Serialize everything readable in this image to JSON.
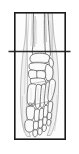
{
  "figure": {
    "kind": "anatomical-line-drawing",
    "caption": "",
    "title": "",
    "background_color": "#ffffff",
    "panel_fill": "#fdfdfd",
    "frame": {
      "name": "image-frame",
      "color": "#1a1a1a",
      "stroke_width": 1.6,
      "x": 14,
      "y": 12,
      "width": 52,
      "height": 128
    },
    "reference_line": {
      "name": "horizontal-section-line",
      "color": "#2b2b2b",
      "stroke_width": 1.3,
      "y": 51.5,
      "x_start": 8.5,
      "x_end": 70.5,
      "description": "horizontal reference line through ankle joint"
    },
    "ink": {
      "bone_outline": "#4a4a4a",
      "bone_fill": "#fbfbfb",
      "soft_tissue_outline": "#9a9a9a",
      "soft_tissue_fill": "#efefef",
      "shading": "#d6d6d6",
      "hatch": "#bcbcbc"
    },
    "structures": [
      {
        "name": "tibia",
        "label": "Tibia"
      },
      {
        "name": "fibula",
        "label": "Fibula"
      },
      {
        "name": "talus",
        "label": "Talus"
      },
      {
        "name": "navicular",
        "label": "Navicular"
      },
      {
        "name": "cuboid",
        "label": "Cuboid"
      },
      {
        "name": "cuneiforms",
        "label": "Cuneiforms"
      },
      {
        "name": "metatarsals",
        "label": "Metatarsals"
      },
      {
        "name": "proximal-phalanges",
        "label": "Proximal phalanges"
      },
      {
        "name": "middle-phalanges",
        "label": "Middle phalanges"
      },
      {
        "name": "distal-phalanges",
        "label": "Distal phalanges"
      },
      {
        "name": "sesamoids",
        "label": "Sesamoids"
      }
    ]
  }
}
